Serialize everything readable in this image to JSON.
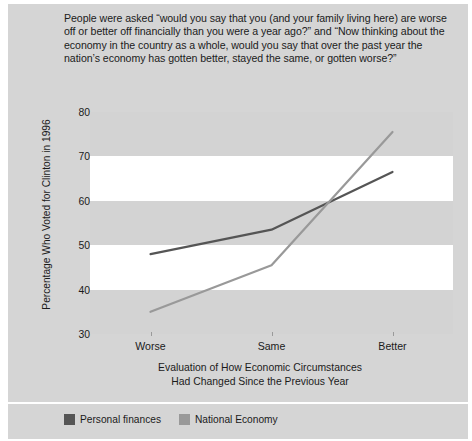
{
  "caption": "People were asked “would you say that you (and your family living here) are worse off or better off financially than you were a year ago?” and “Now thinking about the economy in the country as a whole, would you say that over the past year the nation’s economy has gotten better, stayed the same, or gotten worse?”",
  "colors": {
    "panel_background": "#d5d5d5",
    "plot_background": "#ffffff",
    "band": "#d3d3d3",
    "personal_finances": "#555555",
    "national_economy": "#999999",
    "text": "#1b1b1b"
  },
  "axis": {
    "ylabel": "Percentage Who Voted for Clinton in 1996",
    "xlabel_line1": "Evaluation of How Economic Circumstances",
    "xlabel_line2": "Had Changed Since the Previous Year",
    "yticks": [
      "30",
      "40",
      "50",
      "60",
      "70",
      "80"
    ],
    "xticks": [
      "Worse",
      "Same",
      "Better"
    ]
  },
  "chart_data": {
    "type": "line",
    "title": "",
    "xlabel": "Evaluation of How Economic Circumstances Had Changed Since the Previous Year",
    "ylabel": "Percentage Who Voted for Clinton in 1996",
    "categories": [
      "Worse",
      "Same",
      "Better"
    ],
    "series": [
      {
        "name": "Personal finances",
        "color": "#555555",
        "values": [
          48,
          53.5,
          66.5
        ]
      },
      {
        "name": "National Economy",
        "color": "#999999",
        "values": [
          35,
          45.5,
          75.5
        ]
      }
    ],
    "ylim": [
      30,
      80
    ],
    "ytick_step": 10,
    "grid": "horizontal-bands",
    "legend_position": "bottom-left"
  },
  "legend": [
    {
      "label": "Personal finances",
      "color": "#555555"
    },
    {
      "label": "National Economy",
      "color": "#999999"
    }
  ]
}
